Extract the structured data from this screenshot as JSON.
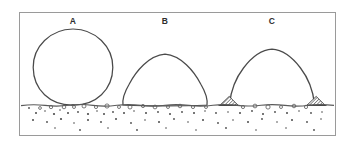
{
  "figure": {
    "frame": {
      "x": 19,
      "y": 12,
      "width": 317,
      "height": 124,
      "stroke_color": "#9a9a9a",
      "fill_color": "#ffffff"
    },
    "background_color": "#ffffff",
    "ink_color": "#4a4a4a",
    "ink_color_dark": "#2e2e2e",
    "surface": {
      "name": "substrate-surface-line",
      "y": 105,
      "x_start": 21,
      "x_end": 334,
      "stroke_color": "#5a5a5a"
    },
    "shapes": [
      {
        "id": "A",
        "label": "A",
        "label_x": 73,
        "label_y": 24,
        "type": "sphere-point-contact",
        "center_x": 73,
        "center_y": 67,
        "radius_x": 40,
        "radius_y": 38,
        "top_y": 29,
        "contact_width": 4,
        "has_feet": false,
        "description": "Non-wetting bubble: near-complete circle meeting the substrate at a single tangent point"
      },
      {
        "id": "B",
        "label": "B",
        "label_x": 165,
        "label_y": 24,
        "type": "dome-flat-base",
        "center_x": 165,
        "top_y": 54,
        "base_y": 105,
        "base_half_width": 42,
        "crown_half_width": 36,
        "has_feet": false,
        "description": "Partially wetting bubble: flattened dome resting on a wide flat base"
      },
      {
        "id": "C",
        "label": "C",
        "label_x": 272,
        "label_y": 24,
        "type": "arch-with-anchored-feet",
        "center_x": 272,
        "top_y": 49,
        "base_y": 105,
        "base_half_width": 45,
        "crown_half_width": 33,
        "has_feet": true,
        "feet": [
          {
            "name": "hatched-foot-left",
            "cx": 229,
            "cy": 105,
            "half_width": 9,
            "height": 9,
            "fill_color": "#6b6b6b"
          },
          {
            "name": "hatched-foot-right",
            "cx": 316,
            "cy": 105,
            "half_width": 9,
            "height": 9,
            "fill_color": "#6b6b6b"
          }
        ],
        "description": "Wetting bubble: tall arch whose two contact lines terminate in hatched pinned feet"
      }
    ],
    "substrate_texture": {
      "name": "granular-substrate-texture",
      "open_circles": [
        {
          "x": 64,
          "y": 107,
          "r": 1.8
        },
        {
          "x": 74,
          "y": 107,
          "r": 1.5
        },
        {
          "x": 84,
          "y": 106,
          "r": 2.0
        },
        {
          "x": 96,
          "y": 107,
          "r": 1.6
        },
        {
          "x": 107,
          "y": 106,
          "r": 2.1
        },
        {
          "x": 119,
          "y": 107,
          "r": 1.5
        },
        {
          "x": 130,
          "y": 107,
          "r": 2.0
        },
        {
          "x": 143,
          "y": 106,
          "r": 1.6
        },
        {
          "x": 155,
          "y": 107,
          "r": 1.9
        },
        {
          "x": 168,
          "y": 107,
          "r": 1.5
        },
        {
          "x": 180,
          "y": 106,
          "r": 1.8
        },
        {
          "x": 193,
          "y": 107,
          "r": 1.6
        },
        {
          "x": 206,
          "y": 107,
          "r": 1.5
        },
        {
          "x": 243,
          "y": 107,
          "r": 1.6
        },
        {
          "x": 255,
          "y": 106,
          "r": 1.9
        },
        {
          "x": 268,
          "y": 107,
          "r": 2.1
        },
        {
          "x": 281,
          "y": 107,
          "r": 1.5
        },
        {
          "x": 294,
          "y": 106,
          "r": 1.8
        },
        {
          "x": 306,
          "y": 107,
          "r": 1.6
        },
        {
          "x": 40,
          "y": 108,
          "r": 1.4
        },
        {
          "x": 51,
          "y": 107,
          "r": 1.7
        }
      ],
      "dots": [
        {
          "x": 29,
          "y": 108,
          "r": 0.9
        },
        {
          "x": 36,
          "y": 113,
          "r": 1.0
        },
        {
          "x": 45,
          "y": 111,
          "r": 0.8
        },
        {
          "x": 54,
          "y": 114,
          "r": 1.1
        },
        {
          "x": 60,
          "y": 110,
          "r": 0.8
        },
        {
          "x": 68,
          "y": 113,
          "r": 1.0
        },
        {
          "x": 78,
          "y": 112,
          "r": 0.9
        },
        {
          "x": 88,
          "y": 114,
          "r": 1.1
        },
        {
          "x": 97,
          "y": 111,
          "r": 0.8
        },
        {
          "x": 104,
          "y": 114,
          "r": 1.0
        },
        {
          "x": 113,
          "y": 112,
          "r": 0.9
        },
        {
          "x": 124,
          "y": 113,
          "r": 1.0
        },
        {
          "x": 134,
          "y": 111,
          "r": 0.8
        },
        {
          "x": 146,
          "y": 113,
          "r": 1.0
        },
        {
          "x": 158,
          "y": 112,
          "r": 0.9
        },
        {
          "x": 170,
          "y": 114,
          "r": 1.0
        },
        {
          "x": 182,
          "y": 112,
          "r": 0.9
        },
        {
          "x": 194,
          "y": 113,
          "r": 1.0
        },
        {
          "x": 205,
          "y": 111,
          "r": 0.8
        },
        {
          "x": 216,
          "y": 113,
          "r": 0.9
        },
        {
          "x": 228,
          "y": 112,
          "r": 0.8
        },
        {
          "x": 240,
          "y": 113,
          "r": 1.0
        },
        {
          "x": 252,
          "y": 111,
          "r": 0.9
        },
        {
          "x": 263,
          "y": 114,
          "r": 1.0
        },
        {
          "x": 275,
          "y": 112,
          "r": 0.9
        },
        {
          "x": 287,
          "y": 113,
          "r": 1.0
        },
        {
          "x": 299,
          "y": 111,
          "r": 0.8
        },
        {
          "x": 311,
          "y": 113,
          "r": 0.9
        },
        {
          "x": 322,
          "y": 112,
          "r": 0.8
        },
        {
          "x": 33,
          "y": 120,
          "r": 1.0
        },
        {
          "x": 47,
          "y": 122,
          "r": 0.9
        },
        {
          "x": 61,
          "y": 119,
          "r": 1.1
        },
        {
          "x": 74,
          "y": 123,
          "r": 0.8
        },
        {
          "x": 88,
          "y": 120,
          "r": 1.0
        },
        {
          "x": 101,
          "y": 122,
          "r": 0.9
        },
        {
          "x": 116,
          "y": 119,
          "r": 1.0
        },
        {
          "x": 131,
          "y": 123,
          "r": 0.9
        },
        {
          "x": 145,
          "y": 120,
          "r": 0.8
        },
        {
          "x": 159,
          "y": 122,
          "r": 1.0
        },
        {
          "x": 174,
          "y": 119,
          "r": 0.9
        },
        {
          "x": 188,
          "y": 122,
          "r": 0.8
        },
        {
          "x": 203,
          "y": 120,
          "r": 1.0
        },
        {
          "x": 218,
          "y": 123,
          "r": 0.9
        },
        {
          "x": 233,
          "y": 120,
          "r": 0.8
        },
        {
          "x": 248,
          "y": 122,
          "r": 1.0
        },
        {
          "x": 262,
          "y": 119,
          "r": 0.9
        },
        {
          "x": 277,
          "y": 122,
          "r": 0.8
        },
        {
          "x": 292,
          "y": 120,
          "r": 1.0
        },
        {
          "x": 307,
          "y": 122,
          "r": 0.9
        },
        {
          "x": 321,
          "y": 119,
          "r": 0.8
        },
        {
          "x": 55,
          "y": 128,
          "r": 0.8
        },
        {
          "x": 80,
          "y": 130,
          "r": 0.9
        },
        {
          "x": 108,
          "y": 128,
          "r": 0.8
        },
        {
          "x": 137,
          "y": 130,
          "r": 0.9
        },
        {
          "x": 166,
          "y": 128,
          "r": 0.8
        },
        {
          "x": 196,
          "y": 130,
          "r": 0.8
        },
        {
          "x": 226,
          "y": 128,
          "r": 0.9
        },
        {
          "x": 256,
          "y": 130,
          "r": 0.8
        },
        {
          "x": 286,
          "y": 128,
          "r": 0.8
        },
        {
          "x": 314,
          "y": 130,
          "r": 0.9
        }
      ]
    }
  }
}
